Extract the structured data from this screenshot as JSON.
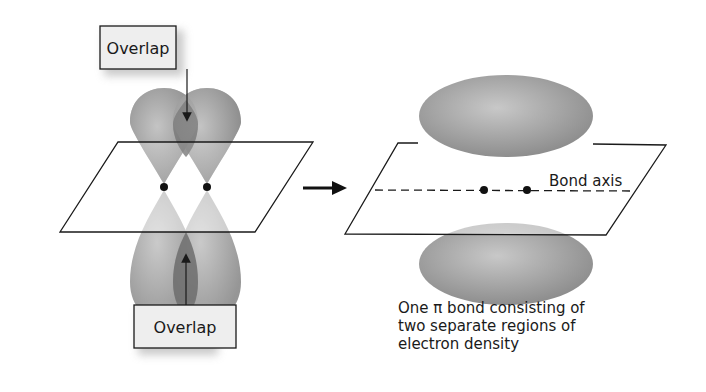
{
  "labels": {
    "overlap_top": "Overlap",
    "overlap_bottom": "Overlap",
    "bond_axis": "Bond axis",
    "caption_line1": "One π bond consisting of",
    "caption_line2": "two separate regions of",
    "caption_line3": "electron density"
  },
  "colors": {
    "lobe": "#9a9a9a",
    "overlap_region": "#6f6f6f",
    "label_box": "#eeeeee",
    "outline": "#1a1a1a"
  }
}
